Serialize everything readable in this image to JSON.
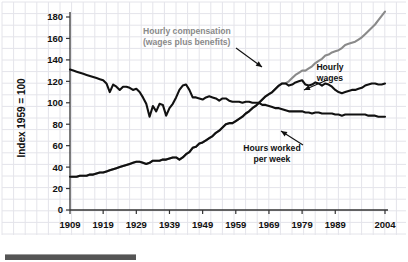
{
  "chart_data": {
    "type": "line",
    "title": "",
    "xlabel": "",
    "ylabel": "Index 1959 = 100",
    "xlim": [
      1909,
      2004
    ],
    "ylim": [
      0,
      185
    ],
    "grid": true,
    "legend_position": "inline-annotations",
    "y_ticks": [
      0,
      20,
      40,
      60,
      80,
      100,
      120,
      140,
      160,
      180
    ],
    "y_tick_labels": [
      "0",
      "20",
      "40",
      "60",
      "80",
      "100",
      "120",
      "140",
      "160",
      "180"
    ],
    "x_ticks": [
      1909,
      1919,
      1929,
      1939,
      1949,
      1959,
      1969,
      1979,
      1989,
      2004
    ],
    "x_tick_labels": [
      "1909",
      "1919",
      "1929",
      "1939",
      "1949",
      "1959",
      "1969",
      "1979",
      "1989",
      "2004"
    ],
    "colors": {
      "hourly_compensation": "#8a8a8a",
      "hourly_wages": "#111111",
      "hours_worked": "#111111",
      "grid": "#e4e4ea",
      "axis": "#333333",
      "background": "#ffffff"
    },
    "series": [
      {
        "name": "Hourly compensation (wages plus benefits)",
        "color": "#8a8a8a",
        "x": [
          1909,
          1910,
          1911,
          1912,
          1913,
          1914,
          1915,
          1916,
          1917,
          1918,
          1919,
          1920,
          1921,
          1922,
          1923,
          1924,
          1925,
          1926,
          1927,
          1928,
          1929,
          1930,
          1931,
          1932,
          1933,
          1934,
          1935,
          1936,
          1937,
          1938,
          1939,
          1940,
          1941,
          1942,
          1943,
          1944,
          1945,
          1946,
          1947,
          1948,
          1949,
          1950,
          1951,
          1952,
          1953,
          1954,
          1955,
          1956,
          1957,
          1958,
          1959,
          1960,
          1961,
          1962,
          1963,
          1964,
          1965,
          1966,
          1967,
          1968,
          1969,
          1970,
          1971,
          1972,
          1973,
          1974,
          1975,
          1976,
          1977,
          1978,
          1979,
          1980,
          1981,
          1982,
          1983,
          1984,
          1985,
          1986,
          1987,
          1988,
          1989,
          1990,
          1991,
          1992,
          1993,
          1994,
          1995,
          1996,
          1997,
          1998,
          1999,
          2000,
          2001,
          2002,
          2003,
          2004
        ],
        "y": [
          31,
          31,
          31,
          32,
          32,
          32,
          33,
          33,
          34,
          35,
          35,
          36,
          37,
          38,
          39,
          40,
          41,
          42,
          43,
          44,
          45,
          45,
          44,
          43,
          44,
          46,
          46,
          46,
          47,
          47,
          48,
          49,
          49,
          47,
          49,
          52,
          54,
          58,
          59,
          62,
          63,
          65,
          67,
          69,
          72,
          74,
          77,
          80,
          81,
          81,
          83,
          85,
          87,
          90,
          92,
          95,
          97,
          100,
          103,
          106,
          108,
          110,
          113,
          116,
          118,
          118,
          120,
          123,
          126,
          128,
          130,
          130,
          132,
          134,
          137,
          139,
          141,
          144,
          145,
          147,
          148,
          149,
          151,
          154,
          155,
          156,
          157,
          159,
          161,
          164,
          167,
          170,
          173,
          177,
          181,
          185
        ]
      },
      {
        "name": "Hourly wages",
        "color": "#111111",
        "x": [
          1909,
          1910,
          1911,
          1912,
          1913,
          1914,
          1915,
          1916,
          1917,
          1918,
          1919,
          1920,
          1921,
          1922,
          1923,
          1924,
          1925,
          1926,
          1927,
          1928,
          1929,
          1930,
          1931,
          1932,
          1933,
          1934,
          1935,
          1936,
          1937,
          1938,
          1939,
          1940,
          1941,
          1942,
          1943,
          1944,
          1945,
          1946,
          1947,
          1948,
          1949,
          1950,
          1951,
          1952,
          1953,
          1954,
          1955,
          1956,
          1957,
          1958,
          1959,
          1960,
          1961,
          1962,
          1963,
          1964,
          1965,
          1966,
          1967,
          1968,
          1969,
          1970,
          1971,
          1972,
          1973,
          1974,
          1975,
          1976,
          1977,
          1978,
          1979,
          1980,
          1981,
          1982,
          1983,
          1984,
          1985,
          1986,
          1987,
          1988,
          1989,
          1990,
          1991,
          1992,
          1993,
          1994,
          1995,
          1996,
          1997,
          1998,
          1999,
          2000,
          2001,
          2002,
          2003,
          2004
        ],
        "y": [
          31,
          31,
          31,
          32,
          32,
          32,
          33,
          33,
          34,
          35,
          35,
          36,
          37,
          38,
          39,
          40,
          41,
          42,
          43,
          44,
          45,
          45,
          44,
          43,
          44,
          46,
          46,
          46,
          47,
          47,
          48,
          49,
          49,
          47,
          49,
          52,
          54,
          58,
          59,
          62,
          63,
          65,
          67,
          69,
          72,
          74,
          77,
          80,
          81,
          81,
          83,
          85,
          87,
          90,
          92,
          95,
          97,
          100,
          103,
          106,
          108,
          110,
          113,
          116,
          118,
          118,
          116,
          117,
          119,
          120,
          121,
          117,
          116,
          117,
          119,
          118,
          116,
          118,
          117,
          115,
          112,
          110,
          109,
          110,
          111,
          112,
          112,
          113,
          114,
          116,
          117,
          118,
          118,
          117,
          117,
          118
        ]
      },
      {
        "name": "Hours worked per week",
        "color": "#111111",
        "x": [
          1909,
          1910,
          1911,
          1912,
          1913,
          1914,
          1915,
          1916,
          1917,
          1918,
          1919,
          1920,
          1921,
          1922,
          1923,
          1924,
          1925,
          1926,
          1927,
          1928,
          1929,
          1930,
          1931,
          1932,
          1933,
          1934,
          1935,
          1936,
          1937,
          1938,
          1939,
          1940,
          1941,
          1942,
          1943,
          1944,
          1945,
          1946,
          1947,
          1948,
          1949,
          1950,
          1951,
          1952,
          1953,
          1954,
          1955,
          1956,
          1957,
          1958,
          1959,
          1960,
          1961,
          1962,
          1963,
          1964,
          1965,
          1966,
          1967,
          1968,
          1969,
          1970,
          1971,
          1972,
          1973,
          1974,
          1975,
          1976,
          1977,
          1978,
          1979,
          1980,
          1981,
          1982,
          1983,
          1984,
          1985,
          1986,
          1987,
          1988,
          1989,
          1990,
          1991,
          1992,
          1993,
          1994,
          1995,
          1996,
          1997,
          1998,
          1999,
          2000,
          2001,
          2002,
          2003,
          2004
        ],
        "y": [
          131,
          130,
          129,
          128,
          127,
          126,
          125,
          124,
          123,
          122,
          121,
          118,
          110,
          117,
          115,
          112,
          115,
          115,
          114,
          112,
          113,
          110,
          105,
          99,
          87,
          97,
          92,
          99,
          98,
          88,
          95,
          99,
          105,
          112,
          116,
          117,
          112,
          105,
          105,
          104,
          103,
          105,
          106,
          105,
          104,
          102,
          104,
          104,
          102,
          101,
          101,
          101,
          100,
          101,
          101,
          100,
          100,
          100,
          98,
          98,
          97,
          96,
          95,
          95,
          94,
          93,
          92,
          92,
          92,
          92,
          92,
          91,
          91,
          90,
          91,
          91,
          90,
          90,
          90,
          90,
          89,
          89,
          88,
          89,
          89,
          89,
          89,
          89,
          89,
          89,
          88,
          88,
          88,
          87,
          87,
          87
        ]
      }
    ],
    "annotations": [
      {
        "id": "hourly-compensation",
        "lines": [
          "Hourly compensation",
          "(wages plus benefits)"
        ],
        "color": "#8a8a8a",
        "text_x": 143,
        "text_y": 34,
        "arrow": {
          "x1": 236,
          "y1": 48,
          "x2": 262,
          "y2": 67
        }
      },
      {
        "id": "hourly-wages",
        "lines": [
          "Hourly",
          "wages"
        ],
        "color": "#111111",
        "text_x": 330,
        "text_y": 70,
        "arrow": {
          "x1": 327,
          "y1": 80,
          "x2": 304,
          "y2": 90
        }
      },
      {
        "id": "hours-worked-per-week",
        "lines": [
          "Hours worked",
          "per week"
        ],
        "color": "#111111",
        "text_x": 272,
        "text_y": 151,
        "arrow": {
          "x1": 303,
          "y1": 145,
          "x2": 281,
          "y2": 131
        }
      }
    ]
  },
  "footer": {
    "scrollbar_present": true
  }
}
